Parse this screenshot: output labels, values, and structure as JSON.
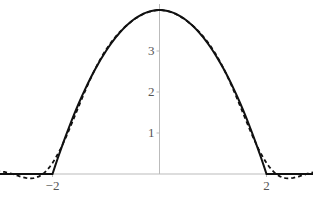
{
  "chart_data": {
    "type": "line",
    "title": "",
    "xlabel": "",
    "ylabel": "",
    "xlim": [
      -5,
      5
    ],
    "ylim": [
      0,
      4
    ],
    "grid": false,
    "legend": null,
    "x_ticks": [
      -4,
      -2,
      2,
      4
    ],
    "x_tick_labels": [
      "−4",
      "−2",
      "2",
      "4"
    ],
    "y_ticks": [
      1,
      2,
      3
    ],
    "y_tick_labels": [
      "1",
      "2",
      "3"
    ],
    "series": [
      {
        "name": "f(x)",
        "style": "solid",
        "color": "#111111",
        "description": "4 - x^2 for |x| < 2, 0 otherwise",
        "x": [
          -5,
          -2,
          -1.5,
          -1,
          -0.5,
          0,
          0.5,
          1,
          1.5,
          2,
          5
        ],
        "y": [
          0,
          0,
          1.75,
          3,
          3.75,
          4,
          3.75,
          3,
          1.75,
          0,
          0
        ]
      },
      {
        "name": "approximation",
        "style": "dashed",
        "color": "#111111",
        "description": "Truncated Fourier approximation with small oscillations outside |x|<2",
        "x": [
          -5,
          -4.5,
          -4,
          -3.5,
          -3,
          -2.5,
          -2.2,
          -2,
          -1.5,
          -1,
          0,
          1,
          1.5,
          2,
          2.2,
          2.5,
          3,
          3.5,
          4,
          4.5,
          5
        ],
        "y": [
          -0.02,
          -0.05,
          0.02,
          0.08,
          0.0,
          -0.15,
          -0.05,
          0.45,
          1.8,
          3.0,
          4.0,
          3.0,
          1.8,
          0.45,
          -0.05,
          -0.15,
          0.0,
          0.08,
          0.02,
          -0.05,
          -0.02
        ]
      }
    ]
  },
  "colors": {
    "axis": "#bbbbbb",
    "curve": "#111111",
    "label": "#555555"
  }
}
